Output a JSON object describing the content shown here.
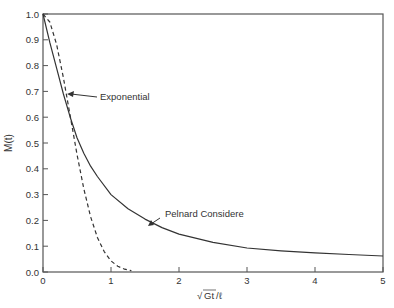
{
  "chart_data": {
    "type": "line",
    "title": "",
    "xlabel": "√Gt/ℓ",
    "ylabel": "M(t)",
    "xlim": [
      0,
      5
    ],
    "ylim": [
      0.0,
      1.0
    ],
    "x_ticks": [
      "0",
      "1",
      "2",
      "3",
      "4",
      "5"
    ],
    "y_ticks": [
      "0.0",
      "0.1",
      "0.2",
      "0.3",
      "0.4",
      "0.5",
      "0.6",
      "0.7",
      "0.8",
      "0.9",
      "1.0"
    ],
    "grid": false,
    "legend": "none (inline annotations with arrows)",
    "series": [
      {
        "name": "Pelnard Considere",
        "style": "solid",
        "x": [
          0,
          0.1,
          0.2,
          0.3,
          0.4,
          0.5,
          0.6,
          0.7,
          0.8,
          1.0,
          1.25,
          1.5,
          1.75,
          2.0,
          2.5,
          3.0,
          3.5,
          4.0,
          4.5,
          5.0
        ],
        "values": [
          1.0,
          0.89,
          0.79,
          0.69,
          0.6,
          0.52,
          0.46,
          0.41,
          0.37,
          0.3,
          0.245,
          0.205,
          0.172,
          0.147,
          0.115,
          0.093,
          0.082,
          0.074,
          0.068,
          0.062
        ]
      },
      {
        "name": "Exponential",
        "style": "dashed",
        "x": [
          0,
          0.1,
          0.2,
          0.3,
          0.4,
          0.5,
          0.6,
          0.7,
          0.8,
          0.9,
          1.0,
          1.1,
          1.2,
          1.3
        ],
        "values": [
          1.0,
          0.969,
          0.882,
          0.753,
          0.605,
          0.456,
          0.323,
          0.214,
          0.134,
          0.079,
          0.043,
          0.022,
          0.011,
          0.005
        ]
      }
    ],
    "annotations": [
      {
        "text": "Exponential",
        "arrow_to": [
          0.35,
          0.68
        ]
      },
      {
        "text": "Pelnard Considere",
        "arrow_to": [
          1.7,
          0.17
        ]
      }
    ]
  },
  "labels": {
    "ylabel": "M(t)",
    "xlabel_radical": "√",
    "xlabel_inner": "Gt",
    "xlabel_tail": "/ℓ",
    "annot_exponential": "Exponential",
    "annot_pelnard": "Pelnard Considere"
  }
}
